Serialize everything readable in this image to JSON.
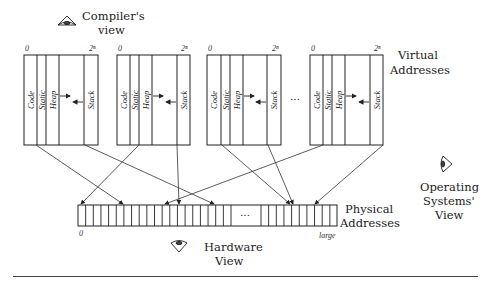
{
  "title_views": {
    "compiler": {
      "line1": "Compiler's",
      "line2": "view",
      "icon": "eye-icon"
    },
    "hardware": {
      "line1": "Hardware",
      "line2": "View",
      "icon": "eye-icon"
    },
    "os": {
      "line1": "Operating",
      "line2": "Systems'",
      "line3": "View",
      "icon": "eye-icon"
    }
  },
  "virtual": {
    "label_line1": "Virtual",
    "label_line2": "Addresses",
    "range_start": "0",
    "range_end": "2ⁿ",
    "ellipsis": "…",
    "segments": [
      "Code",
      "Static",
      "Heap",
      "Stack"
    ],
    "spaces": [
      {
        "x": 24,
        "dividers": [
          37,
          46,
          59,
          84
        ],
        "right": 98
      },
      {
        "x": 117,
        "dividers": [
          130,
          139,
          152,
          177
        ],
        "right": 190
      },
      {
        "x": 207,
        "dividers": [
          221,
          230,
          243,
          267
        ],
        "right": 281
      },
      {
        "x": 310,
        "dividers": [
          323,
          332,
          345,
          370
        ],
        "right": 383
      }
    ]
  },
  "physical": {
    "label_line1": "Physical",
    "label_line2": "Addresses",
    "range_start": "0",
    "range_end": "large",
    "ellipsis": "…",
    "left_cells": 20,
    "right_cells": 10
  },
  "mappings": [
    {
      "from_x": 36,
      "to_x": 123
    },
    {
      "from_x": 85,
      "to_x": 214
    },
    {
      "from_x": 139,
      "to_x": 81
    },
    {
      "from_x": 177,
      "to_x": 179
    },
    {
      "from_x": 222,
      "to_x": 290
    },
    {
      "from_x": 268,
      "to_x": 293
    },
    {
      "from_x": 323,
      "to_x": 165
    },
    {
      "from_x": 383,
      "to_x": 315
    }
  ]
}
